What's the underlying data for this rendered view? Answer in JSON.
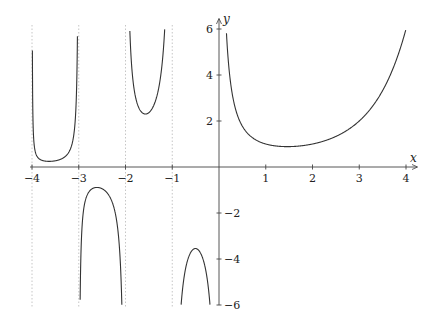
{
  "chart_data": {
    "type": "line",
    "title": "",
    "function": "Gamma function Γ(x)",
    "xlabel": "x",
    "ylabel": "y",
    "xlim": [
      -4,
      4
    ],
    "ylim": [
      -6,
      6
    ],
    "grid": false,
    "legend": null,
    "x_ticks": [
      -4,
      -3,
      -2,
      -1,
      1,
      2,
      3,
      4
    ],
    "x_tick_labels": [
      "−4",
      "−3",
      "−2",
      "−1",
      "1",
      "2",
      "3",
      "4"
    ],
    "y_ticks": [
      -6,
      -4,
      -2,
      2,
      4,
      6
    ],
    "y_tick_labels": [
      "−6",
      "−4",
      "−2",
      "2",
      "4",
      "6"
    ],
    "asymptotes_x": [
      -4,
      -3,
      -2,
      -1
    ],
    "branches": [
      {
        "interval": [
          -4,
          -3
        ],
        "sign": "positive",
        "extremum": {
          "x": -3.64,
          "y": 0.25
        }
      },
      {
        "interval": [
          -3,
          -2
        ],
        "sign": "negative",
        "extremum": {
          "x": -2.61,
          "y": -0.89
        }
      },
      {
        "interval": [
          -2,
          -1
        ],
        "sign": "positive",
        "extremum": {
          "x": -1.57,
          "y": 2.3
        }
      },
      {
        "interval": [
          -1,
          0
        ],
        "sign": "negative",
        "extremum": {
          "x": -0.5,
          "y": -3.54
        }
      },
      {
        "interval": [
          0,
          4
        ],
        "sign": "positive",
        "extremum": {
          "x": 1.46,
          "y": 0.89
        }
      }
    ],
    "sample_points": [
      {
        "x": 0.17,
        "y": 5.6
      },
      {
        "x": 0.5,
        "y": 1.77
      },
      {
        "x": 1,
        "y": 1
      },
      {
        "x": 1.46,
        "y": 0.89
      },
      {
        "x": 2,
        "y": 1
      },
      {
        "x": 2.5,
        "y": 1.33
      },
      {
        "x": 3,
        "y": 2
      },
      {
        "x": 3.5,
        "y": 3.32
      },
      {
        "x": 4,
        "y": 6
      },
      {
        "x": -0.5,
        "y": -3.54
      },
      {
        "x": -1.5,
        "y": 2.36
      },
      {
        "x": -2.5,
        "y": -0.95
      },
      {
        "x": -3.5,
        "y": 0.27
      }
    ]
  }
}
